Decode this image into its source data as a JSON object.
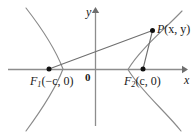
{
  "figure": {
    "axes": {
      "x_label": "x",
      "y_label": "y",
      "origin_label": "0",
      "x_axis_y_px": 69,
      "y_axis_x_px": 95,
      "x_axis_start_px": 8,
      "x_axis_end_px": 186,
      "y_axis_top_px": 8,
      "y_axis_bottom_px": 126
    },
    "points": [
      {
        "name": "F1",
        "label_base": "F",
        "label_sub": "1",
        "label_coords": "(−c, 0)",
        "x_px": 49,
        "y_px": 69,
        "dot": true
      },
      {
        "name": "F2",
        "label_base": "F",
        "label_sub": "2",
        "label_coords": "(c, 0)",
        "x_px": 143,
        "y_px": 69,
        "dot": true
      },
      {
        "name": "P",
        "label_base": "P",
        "label_sub": "",
        "label_coords": "(x, y)",
        "x_px": 152,
        "y_px": 30,
        "dot": true
      }
    ],
    "segments": [
      {
        "name": "segment-f1-p",
        "from": "F1",
        "to": "P"
      },
      {
        "name": "segment-f2-p",
        "from": "F2",
        "to": "P"
      }
    ],
    "curves": {
      "left_branch_vertex_px": 63,
      "right_branch_vertex_px": 128,
      "description": "two hyperbola branches opening left and right"
    },
    "colors": {
      "stroke": "#7a7a7a",
      "axis": "#8a8a8a",
      "segment": "#6f6f6f",
      "text": "#1a1a1a",
      "dot": "#111111",
      "background": "#ffffff"
    }
  }
}
